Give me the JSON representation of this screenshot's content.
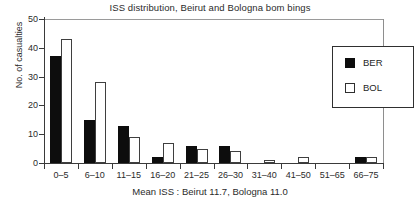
{
  "chart_data": {
    "type": "bar",
    "title": "ISS distribution, Beirut and Bologna bom bings",
    "xlabel": "Mean ISS : Beirut 11.7, Bologna 11.0",
    "ylabel": "No. of casualties",
    "categories": [
      "0–5",
      "6–10",
      "11–15",
      "16–20",
      "21–25",
      "26–30",
      "31–40",
      "41–50",
      "51–65",
      "66–75"
    ],
    "series": [
      {
        "name": "BER",
        "values": [
          37,
          15,
          13,
          2,
          6,
          6,
          0,
          0,
          0,
          2
        ]
      },
      {
        "name": "BOL",
        "values": [
          43,
          28,
          9,
          7,
          5,
          4,
          1,
          2,
          0,
          2
        ]
      }
    ],
    "ylim": [
      0,
      50
    ],
    "yticks": [
      0,
      10,
      20,
      30,
      40,
      50
    ],
    "ytick_labels": [
      "0",
      "10",
      "20",
      "30",
      "40",
      "50"
    ],
    "grid": false,
    "legend": {
      "position": "top-right",
      "entries": [
        {
          "label": "BER",
          "swatch": "filled-square",
          "color": "#0d0d0d"
        },
        {
          "label": "BOL",
          "swatch": "open-square",
          "color": "#ffffff"
        }
      ]
    },
    "colors": {
      "ber_fill": "#0d0d0d",
      "bol_fill": "#ffffff",
      "bol_edge": "#3f3f3f",
      "axis": "#3a3a3a",
      "frame": "#9a9a9a",
      "text": "#2b2b2b",
      "background": "#ffffff"
    }
  }
}
